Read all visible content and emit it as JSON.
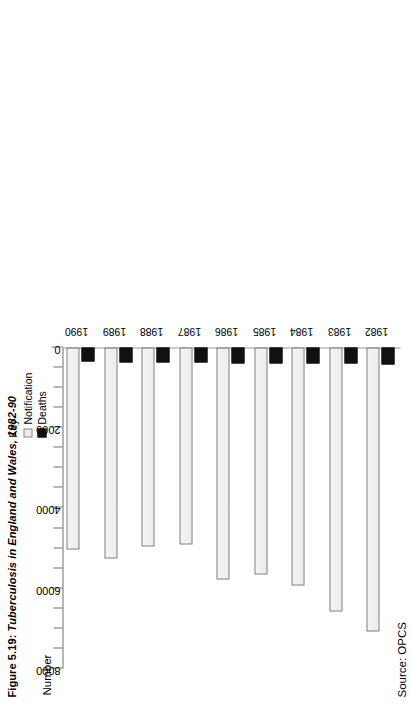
{
  "caption": {
    "figure_number": "Figure 5.19:",
    "title": "Tuberculosis in England and Wales, 1982-90"
  },
  "source": {
    "text": "Source: OPCS"
  },
  "legend": {
    "title": "Key",
    "items": [
      {
        "label": "Notification",
        "color": "#ececec",
        "swatch": "notification"
      },
      {
        "label": "Deaths",
        "color": "#111111",
        "swatch": "deaths"
      }
    ]
  },
  "chart_data": {
    "type": "bar",
    "orientation": "horizontal",
    "title": "Tuberculosis in England and Wales, 1982-90",
    "xlabel": "Number",
    "ylabel": "",
    "axis_title": "Number",
    "categories": [
      "1982",
      "1983",
      "1984",
      "1985",
      "1986",
      "1987",
      "1988",
      "1989",
      "1990"
    ],
    "series": [
      {
        "name": "Notification",
        "values": [
          7070,
          6570,
          5930,
          5650,
          5780,
          4900,
          4950,
          5250,
          5030
        ]
      },
      {
        "name": "Deaths",
        "values": [
          420,
          400,
          400,
          390,
          400,
          370,
          380,
          370,
          350
        ]
      }
    ],
    "value_axis": {
      "min": 0,
      "max": 8000,
      "major_ticks": [
        8000,
        6000,
        4000,
        2000,
        0
      ],
      "major_tick_labels": [
        "8000",
        "6000",
        "4000",
        "2000",
        "0"
      ],
      "minor_tick_interval": 500,
      "grid": false
    },
    "legend_position": "top-right",
    "source": "Source: OPCS"
  }
}
